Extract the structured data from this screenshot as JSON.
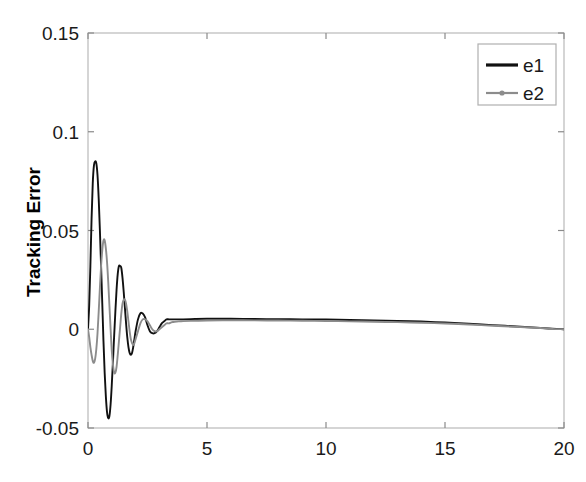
{
  "chart_data": {
    "type": "line",
    "title": "",
    "xlabel": "",
    "ylabel": "Tracking Error",
    "xlim": [
      0,
      20
    ],
    "ylim": [
      -0.05,
      0.15
    ],
    "xticks": [
      0,
      5,
      10,
      15,
      20
    ],
    "xtick_labels": [
      "0",
      "5",
      "10",
      "15",
      "20"
    ],
    "yticks": [
      -0.05,
      0,
      0.05,
      0.1,
      0.15
    ],
    "ytick_labels": [
      "-0.05",
      "0",
      "0.05",
      "0.1",
      "0.15"
    ],
    "grid": false,
    "legend_position": "top-right",
    "legend_entries": [
      "e1",
      "e2"
    ],
    "series": [
      {
        "name": "e1",
        "color": "#111111",
        "marker": "none",
        "x": [
          0,
          0.05,
          0.1,
          0.15,
          0.2,
          0.25,
          0.3,
          0.35,
          0.4,
          0.45,
          0.5,
          0.55,
          0.6,
          0.65,
          0.7,
          0.75,
          0.8,
          0.85,
          0.9,
          0.95,
          1.0,
          1.05,
          1.1,
          1.15,
          1.2,
          1.25,
          1.3,
          1.35,
          1.4,
          1.45,
          1.5,
          1.55,
          1.6,
          1.65,
          1.7,
          1.75,
          1.8,
          1.85,
          1.9,
          1.95,
          2.0,
          2.1,
          2.2,
          2.3,
          2.4,
          2.5,
          2.6,
          2.7,
          2.8,
          2.9,
          3.0,
          3.1,
          3.2,
          3.3,
          3.4,
          3.5,
          3.6,
          3.8,
          4.0,
          4.5,
          5.0,
          6.0,
          7.0,
          8.0,
          9.0,
          10.0,
          11.0,
          12.0,
          13.0,
          14.0,
          15.0,
          16.0,
          17.0,
          18.0,
          19.0,
          19.5,
          20.0
        ],
        "y": [
          0,
          0.012,
          0.032,
          0.056,
          0.074,
          0.083,
          0.085,
          0.084,
          0.078,
          0.066,
          0.05,
          0.032,
          0.013,
          -0.006,
          -0.022,
          -0.034,
          -0.042,
          -0.045,
          -0.044,
          -0.038,
          -0.028,
          -0.016,
          -0.003,
          0.009,
          0.02,
          0.028,
          0.032,
          0.032,
          0.031,
          0.026,
          0.019,
          0.011,
          0.003,
          -0.004,
          -0.009,
          -0.012,
          -0.013,
          -0.012,
          -0.009,
          -0.005,
          -0.001,
          0.005,
          0.008,
          0.008,
          0.006,
          0.002,
          -0.001,
          -0.002,
          -0.002,
          -0.001,
          0.001,
          0.003,
          0.004,
          0.005,
          0.005,
          0.005,
          0.005,
          0.005,
          0.005,
          0.0052,
          0.0053,
          0.0053,
          0.0052,
          0.0051,
          0.005,
          0.0049,
          0.0047,
          0.0045,
          0.0042,
          0.0039,
          0.0034,
          0.0028,
          0.0021,
          0.0014,
          0.0007,
          0.0003,
          0.0
        ]
      },
      {
        "name": "e2",
        "color": "#8c8c8c",
        "marker": "dot",
        "x": [
          0,
          0.05,
          0.1,
          0.15,
          0.2,
          0.25,
          0.3,
          0.35,
          0.4,
          0.45,
          0.5,
          0.55,
          0.6,
          0.65,
          0.7,
          0.75,
          0.8,
          0.85,
          0.9,
          0.95,
          1.0,
          1.05,
          1.1,
          1.15,
          1.2,
          1.25,
          1.3,
          1.35,
          1.4,
          1.45,
          1.5,
          1.55,
          1.6,
          1.65,
          1.7,
          1.75,
          1.8,
          1.85,
          1.9,
          1.95,
          2.0,
          2.1,
          2.2,
          2.3,
          2.4,
          2.5,
          2.6,
          2.7,
          2.8,
          2.9,
          3.0,
          3.1,
          3.2,
          3.3,
          3.4,
          3.5,
          3.6,
          3.8,
          4.0,
          4.5,
          5.0,
          6.0,
          7.0,
          8.0,
          9.0,
          10.0,
          11.0,
          12.0,
          13.0,
          14.0,
          15.0,
          16.0,
          17.0,
          18.0,
          19.0,
          19.5,
          20.0
        ],
        "y": [
          0,
          -0.004,
          -0.009,
          -0.013,
          -0.016,
          -0.017,
          -0.015,
          -0.01,
          -0.002,
          0.009,
          0.021,
          0.032,
          0.04,
          0.045,
          0.045,
          0.041,
          0.034,
          0.024,
          0.012,
          0.0,
          -0.011,
          -0.018,
          -0.022,
          -0.022,
          -0.019,
          -0.013,
          -0.006,
          0.001,
          0.008,
          0.013,
          0.015,
          0.015,
          0.013,
          0.009,
          0.004,
          -0.001,
          -0.005,
          -0.007,
          -0.008,
          -0.007,
          -0.005,
          -0.001,
          0.003,
          0.005,
          0.005,
          0.004,
          0.002,
          0.0,
          -0.001,
          -0.001,
          0.0,
          0.001,
          0.002,
          0.003,
          0.003,
          0.0035,
          0.0037,
          0.004,
          0.0041,
          0.0043,
          0.0044,
          0.0045,
          0.0045,
          0.0044,
          0.0043,
          0.0042,
          0.004,
          0.0038,
          0.0036,
          0.0033,
          0.0029,
          0.0024,
          0.0018,
          0.0012,
          0.0006,
          0.0002,
          0.0
        ]
      }
    ]
  },
  "axes": {
    "box_color": "#b9b9b9",
    "tick_color": "#8a8a8a"
  },
  "legend": {
    "border_color": "#b0b0b0",
    "background": "#ffffff"
  }
}
